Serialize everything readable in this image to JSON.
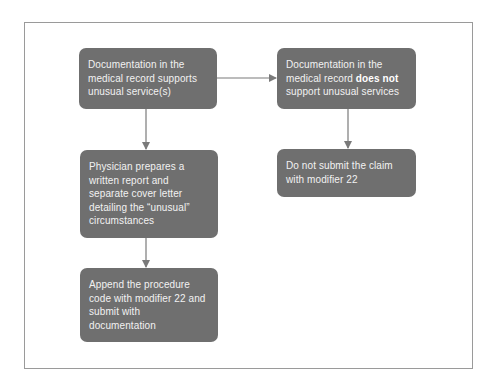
{
  "diagram": {
    "type": "flowchart",
    "colors": {
      "node_fill": "#6f6f6f",
      "node_text": "#f2f2f2",
      "edge": "#7a7a7a",
      "frame": "#9a9a9a",
      "background": "#ffffff"
    },
    "nodes": [
      {
        "id": "n1",
        "text": "Documentation in the medical record supports unusual service(s)"
      },
      {
        "id": "n2",
        "text_before": "Documentation in the medical record ",
        "text_bold": "does not",
        "text_after": " support unusual services"
      },
      {
        "id": "n3",
        "text": "Physician prepares a written report and separate cover letter detailing the “unusual” circumstances"
      },
      {
        "id": "n4",
        "text": "Append the procedure code with modifier 22 and submit with documentation"
      },
      {
        "id": "n5",
        "text": "Do not submit the claim with modifier 22"
      }
    ],
    "edges": [
      {
        "from": "n1",
        "to": "n2"
      },
      {
        "from": "n1",
        "to": "n3"
      },
      {
        "from": "n3",
        "to": "n4"
      },
      {
        "from": "n2",
        "to": "n5"
      }
    ]
  }
}
